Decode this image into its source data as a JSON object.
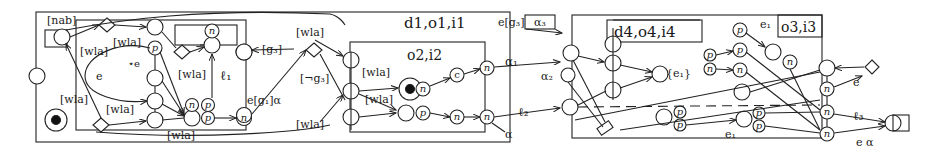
{
  "diagram": {
    "left_panel": {
      "region_label": "d1,o1,i1",
      "inner_region_label": "o2,i2",
      "nab_label": "[nab]",
      "labels": {
        "wla_1": "[wla]",
        "wla_2": "[wla]",
        "wla_3": "[wla]",
        "wla_4": "[wla]",
        "wla_5": "[wla]",
        "wla_6": "[wla]",
        "wla_7": "[wla]",
        "wla_8": "[wla]",
        "wla_9": "[wla]",
        "wla_bottom": "[wla]",
        "e": "e",
        "star_e": "⋆e",
        "l1": "ℓ₁",
        "g3": "[g₃]",
        "not_g3": "[¬g₃]",
        "eg1alpha": "e[g₁]α",
        "alpha": "α",
        "alpha1": "α₁",
        "l2": "ℓ₂"
      },
      "node_letters": {
        "n": "n",
        "p": "p",
        "c": "c"
      }
    },
    "right_panel": {
      "region_label": "d4,o4,i4",
      "corner_label": "o3,i3",
      "labels": {
        "eg3": "e[g₃]",
        "alpha3": "α₃",
        "alpha2": "α₂",
        "e1_set": "{e₁}",
        "e1_top": "e₁",
        "e1_bottom": "e₁",
        "e": "e",
        "l3": "ℓ₃",
        "e_alpha": "e  α"
      }
    }
  }
}
